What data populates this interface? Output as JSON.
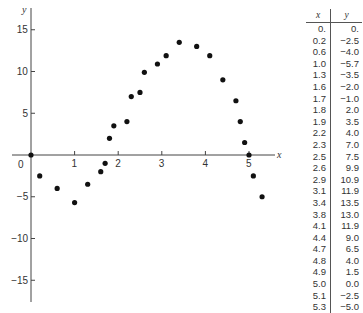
{
  "chart_data": {
    "type": "scatter",
    "title": "",
    "xlabel": "x",
    "ylabel": "y",
    "xlim": [
      -0.45,
      5.7
    ],
    "ylim": [
      -18,
      18
    ],
    "x_ticks": [
      1,
      2,
      3,
      4,
      5
    ],
    "y_ticks": [
      15,
      10,
      5,
      -5,
      -10,
      -15
    ],
    "origin_label": "0",
    "grid": false,
    "legend": null,
    "x": [
      0.0,
      0.2,
      0.6,
      1.0,
      1.3,
      1.6,
      1.7,
      1.8,
      1.9,
      2.2,
      2.3,
      2.5,
      2.6,
      2.9,
      3.1,
      3.4,
      3.8,
      4.1,
      4.4,
      4.7,
      4.8,
      4.9,
      5.0,
      5.1,
      5.3
    ],
    "y": [
      0.0,
      -2.5,
      -4.0,
      -5.7,
      -3.5,
      -2.0,
      -1.0,
      2.0,
      3.5,
      4.0,
      7.0,
      7.5,
      9.9,
      10.9,
      11.9,
      13.5,
      13.0,
      11.9,
      9.0,
      6.5,
      4.0,
      1.5,
      0.0,
      -2.5,
      -5.0
    ]
  },
  "table": {
    "headers": {
      "x": "x",
      "y": "y"
    },
    "rows": [
      {
        "x": "0.",
        "y": "0."
      },
      {
        "x": "0.2",
        "y": "−2.5"
      },
      {
        "x": "0.6",
        "y": "−4.0"
      },
      {
        "x": "1.0",
        "y": "−5.7"
      },
      {
        "x": "1.3",
        "y": "−3.5"
      },
      {
        "x": "1.6",
        "y": "−2.0"
      },
      {
        "x": "1.7",
        "y": "−1.0"
      },
      {
        "x": "1.8",
        "y": "2.0"
      },
      {
        "x": "1.9",
        "y": "3.5"
      },
      {
        "x": "2.2",
        "y": "4.0"
      },
      {
        "x": "2.3",
        "y": "7.0"
      },
      {
        "x": "2.5",
        "y": "7.5"
      },
      {
        "x": "2.6",
        "y": "9.9"
      },
      {
        "x": "2.9",
        "y": "10.9"
      },
      {
        "x": "3.1",
        "y": "11.9"
      },
      {
        "x": "3.4",
        "y": "13.5"
      },
      {
        "x": "3.8",
        "y": "13.0"
      },
      {
        "x": "4.1",
        "y": "11.9"
      },
      {
        "x": "4.4",
        "y": "9.0"
      },
      {
        "x": "4.7",
        "y": "6.5"
      },
      {
        "x": "4.8",
        "y": "4.0"
      },
      {
        "x": "4.9",
        "y": "1.5"
      },
      {
        "x": "5.0",
        "y": "0.0"
      },
      {
        "x": "5.1",
        "y": "−2.5"
      },
      {
        "x": "5.3",
        "y": "−5.0"
      }
    ]
  },
  "colors": {
    "axis": "#444444",
    "point": "#111111",
    "text": "#333333"
  }
}
